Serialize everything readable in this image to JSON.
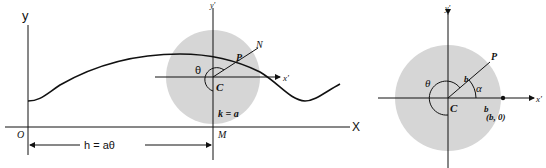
{
  "left_figure": {
    "y_axis_label": "y",
    "x_axis_label": "X",
    "origin_label": "O",
    "distance_label": "h = aθ",
    "circle_center_label": "C",
    "point_label": "P",
    "normal_label": "N",
    "angle_label": "θ",
    "radius_label": "k = a",
    "foot_label": "M",
    "local_x_label": "x′",
    "local_y_label": "y′"
  },
  "right_figure": {
    "local_y_label": "y′",
    "local_x_label": "x′",
    "point_label": "P",
    "center_label": "C",
    "angle_theta_label": "θ",
    "angle_alpha_label": "α",
    "radius_label_slant": "b",
    "radius_label_axis": "b",
    "point_coord_label": "(b, 0)"
  },
  "colors": {
    "disk_fill": "#d6d6d6",
    "line": "#111111"
  }
}
